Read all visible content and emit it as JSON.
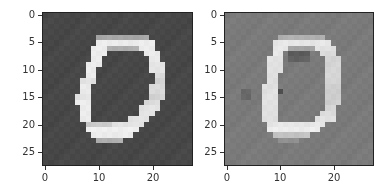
{
  "chart_data": [
    {
      "type": "heatmap",
      "title": "",
      "xlabel": "",
      "ylabel": "",
      "colormap": "gray",
      "shape": [
        28,
        28
      ],
      "xlim": [
        -0.5,
        27.5
      ],
      "ylim": [
        27.5,
        -0.5
      ],
      "xticks": [
        0,
        10,
        20
      ],
      "yticks": [
        0,
        5,
        10,
        15,
        20,
        25
      ],
      "background_color": "#474747",
      "stroke_color": "#f4f4f4",
      "background_value": 0.0,
      "rows_spans": [
        [],
        [],
        [],
        [],
        [
          [
            10,
            19,
            0.55
          ]
        ],
        [
          [
            10,
            20,
            0.95
          ]
        ],
        [
          [
            9,
            11,
            0.95
          ],
          [
            12,
            17,
            0.6
          ],
          [
            18,
            20,
            0.95
          ]
        ],
        [
          [
            9,
            11,
            0.95
          ],
          [
            19,
            21,
            0.95
          ]
        ],
        [
          [
            9,
            10,
            0.95
          ],
          [
            20,
            21,
            0.95
          ]
        ],
        [
          [
            8,
            10,
            0.95
          ],
          [
            20,
            22,
            0.9
          ]
        ],
        [
          [
            8,
            9,
            0.95
          ],
          [
            20,
            22,
            0.9
          ]
        ],
        [
          [
            8,
            9,
            0.95
          ],
          [
            21,
            22,
            0.85
          ]
        ],
        [
          [
            7,
            9,
            0.9
          ],
          [
            21,
            22,
            0.8
          ]
        ],
        [
          [
            7,
            8,
            0.95
          ],
          [
            20,
            22,
            0.85
          ]
        ],
        [
          [
            7,
            8,
            0.95
          ],
          [
            20,
            22,
            0.85
          ]
        ],
        [
          [
            6,
            8,
            0.9
          ],
          [
            20,
            22,
            0.8
          ]
        ],
        [
          [
            6,
            8,
            0.95
          ],
          [
            19,
            21,
            0.85
          ]
        ],
        [
          [
            7,
            8,
            0.95
          ],
          [
            18,
            21,
            0.9
          ]
        ],
        [
          [
            7,
            8,
            0.95
          ],
          [
            18,
            20,
            0.9
          ]
        ],
        [
          [
            7,
            8,
            0.95
          ],
          [
            16,
            19,
            0.9
          ]
        ],
        [
          [
            8,
            12,
            0.75
          ],
          [
            13,
            18,
            0.9
          ]
        ],
        [
          [
            8,
            17,
            0.97
          ]
        ],
        [
          [
            9,
            16,
            0.95
          ]
        ],
        [
          [
            10,
            14,
            0.6
          ]
        ],
        [],
        [],
        [],
        []
      ]
    },
    {
      "type": "heatmap",
      "title": "",
      "xlabel": "",
      "ylabel": "",
      "colormap": "gray",
      "shape": [
        28,
        28
      ],
      "xlim": [
        -0.5,
        27.5
      ],
      "ylim": [
        27.5,
        -0.5
      ],
      "xticks": [
        0,
        10,
        20
      ],
      "yticks": [
        0,
        5,
        10,
        15,
        20,
        25
      ],
      "background_color": "#7a7a7a",
      "stroke_color": "#f2f2f2",
      "background_value": 0.0,
      "rows_spans": [
        [],
        [],
        [],
        [],
        [
          [
            10,
            18,
            0.45
          ]
        ],
        [
          [
            9,
            19,
            0.9
          ]
        ],
        [
          [
            9,
            11,
            0.9
          ],
          [
            12,
            16,
            0.35
          ],
          [
            17,
            20,
            0.85
          ]
        ],
        [
          [
            9,
            10,
            0.9
          ],
          [
            12,
            15,
            -0.25
          ],
          [
            18,
            20,
            0.8
          ]
        ],
        [
          [
            8,
            10,
            0.85
          ],
          [
            12,
            15,
            -0.2
          ],
          [
            19,
            21,
            0.75
          ]
        ],
        [
          [
            8,
            10,
            0.85
          ],
          [
            19,
            21,
            0.75
          ]
        ],
        [
          [
            8,
            10,
            0.85
          ],
          [
            19,
            21,
            0.75
          ]
        ],
        [
          [
            8,
            9,
            0.85
          ],
          [
            19,
            21,
            0.75
          ]
        ],
        [
          [
            8,
            9,
            0.85
          ],
          [
            19,
            21,
            0.75
          ]
        ],
        [
          [
            7,
            9,
            0.85
          ],
          [
            19,
            21,
            0.7
          ]
        ],
        [
          [
            3,
            4,
            -0.15
          ],
          [
            7,
            9,
            0.85
          ],
          [
            10,
            10,
            -0.35
          ],
          [
            19,
            21,
            0.7
          ]
        ],
        [
          [
            3,
            4,
            -0.15
          ],
          [
            7,
            9,
            0.85
          ],
          [
            19,
            21,
            0.7
          ]
        ],
        [
          [
            7,
            9,
            0.85
          ],
          [
            19,
            21,
            0.7
          ]
        ],
        [
          [
            7,
            9,
            0.85
          ],
          [
            19,
            20,
            0.75
          ]
        ],
        [
          [
            7,
            9,
            0.85
          ],
          [
            18,
            20,
            0.8
          ]
        ],
        [
          [
            7,
            9,
            0.85
          ],
          [
            17,
            20,
            0.85
          ]
        ],
        [
          [
            8,
            18,
            0.9
          ]
        ],
        [
          [
            8,
            17,
            0.95
          ]
        ],
        [
          [
            9,
            15,
            0.6
          ]
        ],
        [
          [
            10,
            13,
            0.2
          ]
        ],
        [],
        [],
        [],
        []
      ]
    }
  ],
  "figure": {
    "panels": [
      {
        "name": "original",
        "yticklabels": [
          "0",
          "5",
          "10",
          "15",
          "20",
          "25"
        ],
        "xticklabels": [
          "0",
          "10",
          "20"
        ]
      },
      {
        "name": "reconstruction",
        "yticklabels": [
          "0",
          "5",
          "10",
          "15",
          "20",
          "25"
        ],
        "xticklabels": [
          "0",
          "10",
          "20"
        ]
      }
    ]
  }
}
